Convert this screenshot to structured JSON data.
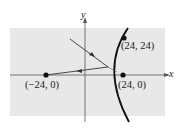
{
  "diagram": {
    "type": "hyperbola-reflection",
    "axes": {
      "x_label": "x",
      "y_label": "y"
    },
    "points": [
      {
        "name": "focus-left",
        "label": "(−24, 0)"
      },
      {
        "name": "focus-right",
        "label": "(24, 0)"
      },
      {
        "name": "point-on-curve",
        "label": "(24, 24)"
      }
    ],
    "colors": {
      "background_panel": "#e8e8e8",
      "curve": "#111111",
      "axes": "#555555"
    }
  }
}
